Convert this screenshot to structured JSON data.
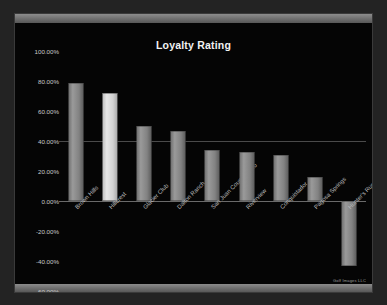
{
  "chart_data": {
    "type": "bar",
    "title": "Loyalty Rating",
    "xlabel": "",
    "ylabel": "",
    "ylim": [
      -60,
      100
    ],
    "ytick_step": 20,
    "grid": true,
    "legend": null,
    "tick_format": "percent-2dp",
    "categories": [
      "Brown Hills",
      "Hillcrest",
      "Glacier Club",
      "Dalton Ranch",
      "San Juan Country Club",
      "Riverview",
      "Conquistador",
      "Pagosa Springs",
      "Hunter's Run"
    ],
    "values": [
      79,
      72,
      50,
      47,
      34,
      33,
      31,
      16,
      -43
    ],
    "highlight_index": 1,
    "ytick_labels": [
      "100.00%",
      "80.00%",
      "60.00%",
      "40.00%",
      "20.00%",
      "0.00%",
      "-20.00%",
      "-40.00%",
      "-60.00%"
    ],
    "ytick_values": [
      100,
      80,
      60,
      40,
      20,
      0,
      -20,
      -40,
      -60
    ]
  },
  "slide": {
    "watermark": "Golf Images LLC"
  },
  "colors": {
    "background": "#232323",
    "plot_background": "#050505",
    "bar": "#8a8a8a",
    "bar_highlight": "#e0e0e0",
    "gridline": "#4a4a4a",
    "zeroline": "#6a6a6a",
    "text": "#c9c9c9",
    "title_text": "#f2f2f2"
  }
}
